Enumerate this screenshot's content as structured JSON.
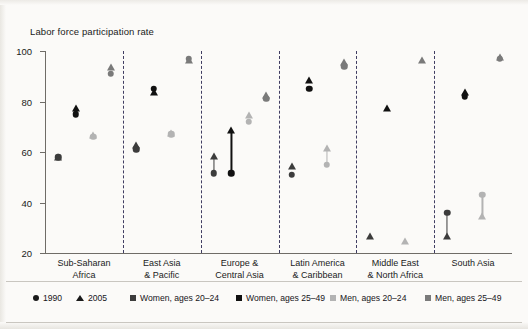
{
  "chart_data": {
    "type": "scatter",
    "title": "Labor force participation rate",
    "xlabel": "",
    "ylabel": "Labor force participation rate",
    "ylim": [
      20,
      100
    ],
    "yticks": [
      20,
      40,
      60,
      80,
      100
    ],
    "grid": false,
    "legend_position": "bottom",
    "year_markers": [
      {
        "label": "1990",
        "shape": "circle"
      },
      {
        "label": "2005",
        "shape": "triangle"
      }
    ],
    "series_colors": [
      {
        "name": "Women, ages 20–24",
        "color": "#3c3c3c"
      },
      {
        "name": "Women, ages 25–49",
        "color": "#111111"
      },
      {
        "name": "Men, ages 20–24",
        "color": "#b3b3b3"
      },
      {
        "name": "Men, ages 25–49",
        "color": "#7a7a7a"
      }
    ],
    "categories": [
      "Sub-Saharan Africa",
      "East Asia & Pacific",
      "Europe & Central Asia",
      "Latin America & Caribbean",
      "Middle East & North Africa",
      "South Asia"
    ],
    "points": [
      {
        "region": "Sub-Saharan Africa",
        "series": "Women, ages 20–24",
        "v1990": 58,
        "v2005": 57.5
      },
      {
        "region": "Sub-Saharan Africa",
        "series": "Women, ages 25–49",
        "v1990": 75,
        "v2005": 77
      },
      {
        "region": "Sub-Saharan Africa",
        "series": "Men, ages 20–24",
        "v1990": 66,
        "v2005": 66
      },
      {
        "region": "Sub-Saharan Africa",
        "series": "Men, ages 25–49",
        "v1990": 91,
        "v2005": 93
      },
      {
        "region": "East Asia & Pacific",
        "series": "Women, ages 20–24",
        "v1990": 61,
        "v2005": 62
      },
      {
        "region": "East Asia & Pacific",
        "series": "Women, ages 25–49",
        "v1990": 85,
        "v2005": 83
      },
      {
        "region": "East Asia & Pacific",
        "series": "Men, ages 20–24",
        "v1990": 67,
        "v2005": 67
      },
      {
        "region": "East Asia & Pacific",
        "series": "Men, ages 25–49",
        "v1990": 97,
        "v2005": 96
      },
      {
        "region": "Europe & Central Asia",
        "series": "Women, ages 20–24",
        "v1990": 51.5,
        "v2005": 58
      },
      {
        "region": "Europe & Central Asia",
        "series": "Women, ages 25–49",
        "v1990": 51.5,
        "v2005": 68
      },
      {
        "region": "Europe & Central Asia",
        "series": "Men, ages 20–24",
        "v1990": 72,
        "v2005": 74
      },
      {
        "region": "Europe & Central Asia",
        "series": "Men, ages 25–49",
        "v1990": 81,
        "v2005": 82
      },
      {
        "region": "Latin America & Caribbean",
        "series": "Women, ages 20–24",
        "v1990": 51,
        "v2005": 54
      },
      {
        "region": "Latin America & Caribbean",
        "series": "Women, ages 25–49",
        "v1990": 85,
        "v2005": 88
      },
      {
        "region": "Latin America & Caribbean",
        "series": "Men, ages 20–24",
        "v1990": 55,
        "v2005": 61
      },
      {
        "region": "Latin America & Caribbean",
        "series": "Men, ages 25–49",
        "v1990": 94,
        "v2005": 95
      },
      {
        "region": "Middle East & North Africa",
        "series": "Women, ages 20–24",
        "v1990": null,
        "v2005": 26
      },
      {
        "region": "Middle East & North Africa",
        "series": "Women, ages 25–49",
        "v1990": null,
        "v2005": 77
      },
      {
        "region": "Middle East & North Africa",
        "series": "Men, ages 20–24",
        "v1990": null,
        "v2005": 24
      },
      {
        "region": "Middle East & North Africa",
        "series": "Men, ages 25–49",
        "v1990": null,
        "v2005": 96
      },
      {
        "region": "South Asia",
        "series": "Women, ages 20–24",
        "v1990": 36,
        "v2005": 26
      },
      {
        "region": "South Asia",
        "series": "Women, ages 25–49",
        "v1990": 82,
        "v2005": 83
      },
      {
        "region": "South Asia",
        "series": "Men, ages 20–24",
        "v1990": 43,
        "v2005": 34
      },
      {
        "region": "South Asia",
        "series": "Men, ages 25–49",
        "v1990": 97,
        "v2005": 97
      }
    ]
  },
  "axis": {
    "title": "Labor force participation rate",
    "tick_labels": [
      "100",
      "80",
      "60",
      "40",
      "20"
    ]
  },
  "regions": [
    {
      "line1": "Sub-Saharan",
      "line2": "Africa"
    },
    {
      "line1": "East Asia",
      "line2": "& Pacific"
    },
    {
      "line1": "Europe &",
      "line2": "Central Asia"
    },
    {
      "line1": "Latin America",
      "line2": "& Caribbean"
    },
    {
      "line1": "Middle East",
      "line2": "& North Africa"
    },
    {
      "line1": "South Asia",
      "line2": ""
    }
  ],
  "legend": {
    "years": [
      {
        "label": "1990",
        "icon": "circle-marker-icon"
      },
      {
        "label": "2005",
        "icon": "triangle-marker-icon"
      }
    ],
    "series": [
      {
        "label": "Women, ages 20–24",
        "color": "#3c3c3c",
        "icon": "square-swatch-icon"
      },
      {
        "label": "Women, ages 25–49",
        "color": "#111111",
        "icon": "square-swatch-icon"
      },
      {
        "label": "Men, ages 20–24",
        "color": "#b3b3b3",
        "icon": "square-swatch-icon"
      },
      {
        "label": "Men, ages 25–49",
        "color": "#7a7a7a",
        "icon": "square-swatch-icon"
      }
    ]
  }
}
